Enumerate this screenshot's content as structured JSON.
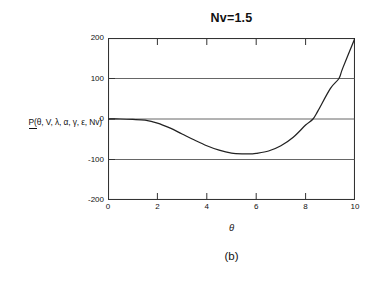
{
  "figure": {
    "title": "Nv=1.5",
    "caption": "(b)",
    "xlabel": "θ",
    "ylabel_prefix": "P(",
    "ylabel_rest": "θ, V, λ, α, γ, ε, Nv)",
    "ylabel_full": "P(θ, V, λ, α, γ, ε, Nv)",
    "line_color": "#222222",
    "axis_color": "#333333",
    "grid_color": "#555555",
    "background": "#ffffff"
  },
  "chart_data": {
    "type": "line",
    "title": "Nv=1.5",
    "xlabel": "θ",
    "ylabel": "P(θ, V, λ, α, γ, ε, Nv)",
    "xlim": [
      0,
      10
    ],
    "ylim": [
      -200,
      200
    ],
    "xticks": [
      0,
      2,
      4,
      6,
      8,
      10
    ],
    "yticks": [
      200,
      100,
      0,
      -100,
      -200
    ],
    "xtick_labels": [
      "0",
      "2",
      "4",
      "6",
      "8",
      "10"
    ],
    "ytick_labels": [
      "200",
      "100",
      "0",
      "-100",
      "-200"
    ],
    "grid": "horizontal-gridlines-at-100-0-minus100",
    "legend": "none",
    "series": [
      {
        "name": "P(θ, V, λ, α, γ, ε, Nv)",
        "x": [
          0.0,
          0.5,
          1.0,
          1.5,
          2.0,
          2.5,
          3.0,
          3.5,
          4.0,
          4.5,
          5.0,
          5.5,
          5.8,
          6.0,
          6.5,
          7.0,
          7.5,
          8.0,
          8.3,
          8.5,
          9.0,
          9.35,
          9.5,
          10.0
        ],
        "y": [
          0,
          0,
          -1,
          -3,
          -10,
          -22,
          -37,
          -52,
          -66,
          -77,
          -84,
          -86,
          -86,
          -85,
          -79,
          -66,
          -45,
          -15,
          0,
          20,
          75,
          100,
          125,
          200
        ]
      }
    ]
  }
}
